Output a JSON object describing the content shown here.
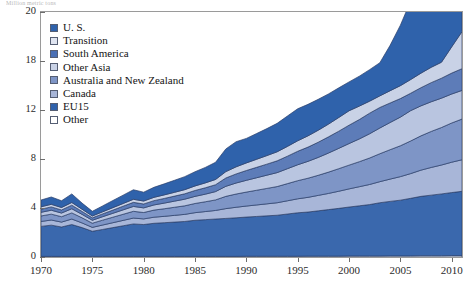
{
  "caption": {
    "text": "Million metric tons"
  },
  "chart_data": {
    "type": "area",
    "stacked": true,
    "title": "",
    "subtitle": "",
    "xlabel": "",
    "ylabel": "",
    "grid": false,
    "legend_position": "top-left-inside",
    "xlim": [
      1970,
      2011
    ],
    "ylim": [
      0,
      21
    ],
    "xticks": [
      1970,
      1975,
      1980,
      1985,
      1990,
      1995,
      2000,
      2005,
      2010
    ],
    "yticks": [
      0,
      4,
      8,
      12,
      18,
      20
    ],
    "ytick_labels": [
      "0",
      "4",
      "8",
      "12",
      "18",
      "20"
    ],
    "x": [
      1970,
      1971,
      1972,
      1973,
      1974,
      1975,
      1976,
      1977,
      1978,
      1979,
      1980,
      1981,
      1982,
      1983,
      1984,
      1985,
      1986,
      1987,
      1988,
      1989,
      1990,
      1991,
      1992,
      1993,
      1994,
      1995,
      1996,
      1997,
      1998,
      1999,
      2000,
      2001,
      2002,
      2003,
      2004,
      2005,
      2006,
      2007,
      2008,
      2009,
      2010,
      2011
    ],
    "stack_order_top_to_bottom": [
      "U. S.",
      "Transition",
      "South America",
      "Other Asia",
      "Australia and New Zealand",
      "Canada",
      "EU15",
      "Other"
    ],
    "series": [
      {
        "name": "Other",
        "color": "#ffffff",
        "values": [
          0.05,
          0.05,
          0.05,
          0.05,
          0.05,
          0.05,
          0.05,
          0.05,
          0.05,
          0.05,
          0.05,
          0.05,
          0.05,
          0.05,
          0.05,
          0.05,
          0.05,
          0.05,
          0.05,
          0.05,
          0.06,
          0.06,
          0.06,
          0.06,
          0.06,
          0.06,
          0.07,
          0.07,
          0.07,
          0.07,
          0.08,
          0.08,
          0.08,
          0.08,
          0.09,
          0.09,
          0.09,
          0.1,
          0.1,
          0.1,
          0.11,
          0.11
        ]
      },
      {
        "name": "EU15",
        "color": "#3a68ad",
        "values": [
          2.45,
          2.55,
          2.4,
          2.6,
          2.35,
          2.05,
          2.2,
          2.35,
          2.5,
          2.65,
          2.6,
          2.7,
          2.75,
          2.8,
          2.85,
          2.95,
          3.0,
          3.05,
          3.1,
          3.15,
          3.2,
          3.25,
          3.3,
          3.35,
          3.45,
          3.55,
          3.6,
          3.7,
          3.8,
          3.9,
          4.0,
          4.1,
          4.2,
          4.35,
          4.45,
          4.55,
          4.7,
          4.85,
          4.95,
          5.05,
          5.15,
          5.25
        ]
      },
      {
        "name": "Canada",
        "color": "#a8b6d8",
        "values": [
          0.4,
          0.42,
          0.4,
          0.45,
          0.38,
          0.32,
          0.36,
          0.4,
          0.44,
          0.48,
          0.46,
          0.5,
          0.52,
          0.55,
          0.58,
          0.62,
          0.66,
          0.7,
          0.8,
          0.86,
          0.9,
          0.94,
          0.98,
          1.02,
          1.08,
          1.14,
          1.2,
          1.26,
          1.32,
          1.4,
          1.48,
          1.56,
          1.64,
          1.72,
          1.82,
          1.92,
          2.02,
          2.14,
          2.26,
          2.36,
          2.48,
          2.58
        ]
      },
      {
        "name": "Australia and New Zealand",
        "color": "#7e95c6",
        "values": [
          0.45,
          0.48,
          0.44,
          0.5,
          0.42,
          0.34,
          0.4,
          0.45,
          0.5,
          0.55,
          0.52,
          0.58,
          0.62,
          0.66,
          0.7,
          0.75,
          0.8,
          0.86,
          1.0,
          1.08,
          1.14,
          1.2,
          1.26,
          1.32,
          1.4,
          1.48,
          1.56,
          1.64,
          1.74,
          1.84,
          1.94,
          2.04,
          2.16,
          2.28,
          2.4,
          2.52,
          2.66,
          2.8,
          2.94,
          3.06,
          3.2,
          3.32
        ]
      },
      {
        "name": "Other Asia",
        "color": "#b9c5e0",
        "values": [
          0.3,
          0.32,
          0.3,
          0.34,
          0.28,
          0.24,
          0.28,
          0.32,
          0.36,
          0.4,
          0.38,
          0.42,
          0.46,
          0.5,
          0.54,
          0.58,
          0.62,
          0.68,
          0.82,
          0.9,
          0.96,
          1.02,
          1.08,
          1.14,
          1.22,
          1.3,
          1.38,
          1.46,
          1.56,
          1.66,
          1.76,
          1.86,
          1.98,
          2.1,
          2.22,
          2.34,
          2.48,
          2.62,
          2.76,
          2.88,
          3.02,
          3.14
        ]
      },
      {
        "name": "South America",
        "color": "#5d7cb8",
        "values": [
          0.25,
          0.27,
          0.25,
          0.29,
          0.24,
          0.2,
          0.23,
          0.26,
          0.3,
          0.33,
          0.32,
          0.35,
          0.38,
          0.41,
          0.44,
          0.48,
          0.52,
          0.56,
          0.68,
          0.74,
          0.8,
          0.85,
          0.9,
          0.96,
          1.02,
          1.1,
          1.16,
          1.24,
          1.32,
          1.4,
          1.5,
          1.58,
          1.68,
          1.78,
          1.88,
          1.98,
          2.1,
          2.22,
          2.34,
          2.44,
          2.56,
          2.66
        ]
      },
      {
        "name": "Transition",
        "color": "#c9d2e6",
        "values": [
          0.2,
          0.21,
          0.2,
          0.22,
          0.18,
          0.15,
          0.17,
          0.2,
          0.22,
          0.25,
          0.24,
          0.27,
          0.29,
          0.31,
          0.34,
          0.37,
          0.4,
          0.43,
          0.52,
          0.58,
          0.62,
          0.66,
          0.7,
          0.74,
          0.8,
          0.86,
          0.92,
          0.98,
          1.04,
          1.12,
          1.18,
          1.26,
          1.34,
          1.42,
          1.5,
          1.58,
          1.68,
          1.78,
          1.88,
          1.96,
          2.06,
          2.14
        ]
      },
      {
        "name": "U. S.",
        "color": "#2f62ab",
        "values": [
          0.55,
          0.6,
          0.55,
          0.7,
          0.5,
          0.38,
          0.48,
          0.58,
          0.68,
          0.78,
          0.72,
          0.82,
          0.9,
          0.98,
          1.06,
          1.16,
          1.26,
          1.4,
          1.85,
          2.05,
          2.0,
          2.1,
          2.2,
          2.32,
          2.48,
          2.66,
          2.8,
          2.96,
          3.12,
          3.32,
          3.5,
          3.66,
          3.86,
          4.06,
          4.28,
          4.48,
          4.72,
          4.96,
          5.2,
          5.38,
          5.62,
          5.84
        ]
      }
    ],
    "totals": [
      4.65,
      4.9,
      4.59,
      5.15,
      4.35,
      3.73,
      4.17,
      4.61,
      5.05,
      5.49,
      5.29,
      5.79,
      6.17,
      6.56,
      6.96,
      7.46,
      7.91,
      8.35,
      10.02,
      10.61,
      10.88,
      11.38,
      11.88,
      12.37,
      13.01,
      13.75,
      14.29,
      14.91,
      15.57,
      16.41,
      17.24,
      18.04,
      18.94,
      19.89,
      20.74,
      21.56,
      22.55,
      23.57,
      24.53,
      25.33,
      26.4,
      27.29
    ]
  },
  "legend": {
    "items": [
      {
        "label": "U. S.",
        "color": "#2f62ab"
      },
      {
        "label": "Transition",
        "color": "#dfe4f0"
      },
      {
        "label": "South America",
        "color": "#4a6fb4"
      },
      {
        "label": "Other Asia",
        "color": "#c9d2e6"
      },
      {
        "label": "Australia and New Zealand",
        "color": "#7e95c6"
      },
      {
        "label": "Canada",
        "color": "#a8b6d8"
      },
      {
        "label": "EU15",
        "color": "#2f62ab"
      },
      {
        "label": "Other",
        "color": "#ffffff"
      }
    ]
  }
}
